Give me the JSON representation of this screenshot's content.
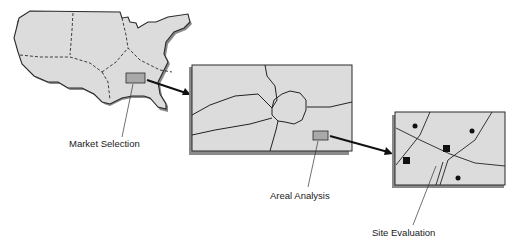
{
  "diagram": {
    "stages": [
      {
        "id": "market",
        "label": "Market Selection"
      },
      {
        "id": "areal",
        "label": "Areal Analysis"
      },
      {
        "id": "site",
        "label": "Site Evaluation"
      }
    ],
    "colors": {
      "map_fill": "#dcdcdc",
      "shadow": "#8a8a8a",
      "highlight_box": "#a9a9a9",
      "line": "#1a1a1a"
    }
  }
}
